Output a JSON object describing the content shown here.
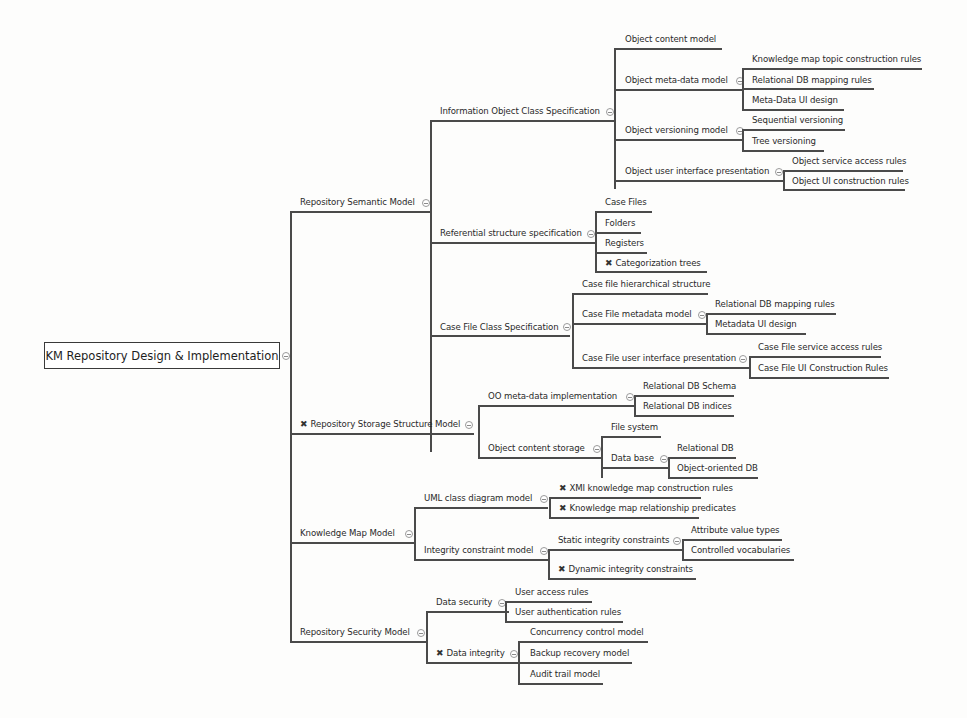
{
  "root": {
    "label": "KM Repository Design & Implementation"
  },
  "icons": {
    "collapse": "collapse-circle-icon",
    "cross": "✖"
  },
  "nodes": {
    "rsm": {
      "label": "Repository Semantic Model"
    },
    "iocs": {
      "label": "Information Object Class Specification"
    },
    "ocm": {
      "label": "Object content model"
    },
    "omdm": {
      "label": "Object meta-data model"
    },
    "kmtcr": {
      "label": "Knowledge map topic construction rules"
    },
    "rdbmr1": {
      "label": "Relational DB mapping rules"
    },
    "mdui": {
      "label": "Meta-Data UI design"
    },
    "ovm": {
      "label": "Object versioning model"
    },
    "sv": {
      "label": "Sequential versioning"
    },
    "tv": {
      "label": "Tree versioning"
    },
    "ouip": {
      "label": "Object user interface presentation"
    },
    "osar": {
      "label": "Object service access rules"
    },
    "ouicr": {
      "label": "Object UI construction rules"
    },
    "rss": {
      "label": "Referential structure specification"
    },
    "cf": {
      "label": "Case Files"
    },
    "fo": {
      "label": "Folders"
    },
    "re": {
      "label": "Registers"
    },
    "ct": {
      "label": "Categorization trees",
      "flag": "cross"
    },
    "cfcs": {
      "label": "Case File Class Specification"
    },
    "cfhs": {
      "label": "Case file hierarchical structure"
    },
    "cfmm": {
      "label": "Case File metadata model"
    },
    "rdbmr2": {
      "label": "Relational DB mapping rules"
    },
    "mduid": {
      "label": "Metadata UI design"
    },
    "cfuip": {
      "label": "Case File user interface presentation"
    },
    "cfsar": {
      "label": "Case File service access rules"
    },
    "cfuicr": {
      "label": "Case File UI Construction Rules"
    },
    "rssm": {
      "label": "Repository Storage Structure Model",
      "flag": "cross"
    },
    "oomdi": {
      "label": "OO meta-data implementation"
    },
    "rdbs": {
      "label": "Relational DB Schema"
    },
    "rdbi": {
      "label": "Relational DB indices"
    },
    "ocs": {
      "label": "Object content storage"
    },
    "fs": {
      "label": "File system"
    },
    "db": {
      "label": "Data base"
    },
    "rdb": {
      "label": "Relational DB"
    },
    "oodb": {
      "label": "Object-oriented DB"
    },
    "kmm": {
      "label": "Knowledge Map Model"
    },
    "ucdm": {
      "label": "UML class diagram model"
    },
    "xmi": {
      "label": "XMI knowledge map construction rules",
      "flag": "cross"
    },
    "kmrp": {
      "label": "Knowledge map relationship predicates",
      "flag": "cross"
    },
    "icm": {
      "label": "Integrity constraint model"
    },
    "sic": {
      "label": "Static integrity constraints"
    },
    "avt": {
      "label": "Attribute value types"
    },
    "cv": {
      "label": "Controlled vocabularies"
    },
    "dic": {
      "label": "Dynamic integrity constraints",
      "flag": "cross"
    },
    "rsecm": {
      "label": "Repository Security Model"
    },
    "ds": {
      "label": "Data security"
    },
    "uar": {
      "label": "User access rules"
    },
    "uaur": {
      "label": "User authentication rules"
    },
    "di": {
      "label": "Data integrity",
      "flag": "cross"
    },
    "ccm": {
      "label": "Concurrency control model"
    },
    "brm": {
      "label": "Backup recovery model"
    },
    "atm": {
      "label": "Audit trail model"
    }
  }
}
